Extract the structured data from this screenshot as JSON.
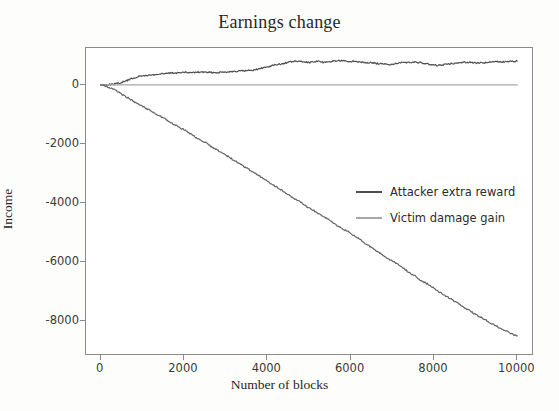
{
  "chart_data": {
    "type": "line",
    "title": "Earnings change",
    "xlabel": "Number of blocks",
    "ylabel": "Income",
    "xlim": [
      -350,
      10400
    ],
    "ylim": [
      -9200,
      1250
    ],
    "xticks": [
      0,
      2000,
      4000,
      6000,
      8000,
      10000
    ],
    "xtick_labels": [
      "0",
      "2000",
      "4000",
      "6000",
      "8000",
      "10000"
    ],
    "yticks": [
      0,
      -2000,
      -4000,
      -6000,
      -8000
    ],
    "ytick_labels": [
      "0",
      "-2000",
      "-4000",
      "-6000",
      "-8000"
    ],
    "grid": false,
    "legend_position": "center-right",
    "series": [
      {
        "name": "Attacker extra reward",
        "color": "#4f4f4f",
        "x": [
          0,
          100,
          200,
          300,
          400,
          500,
          600,
          700,
          800,
          900,
          1000,
          1100,
          1200,
          1300,
          1400,
          1500,
          1600,
          1700,
          1800,
          1900,
          2000,
          2100,
          2200,
          2300,
          2400,
          2500,
          2600,
          2700,
          2800,
          2900,
          3000,
          3100,
          3200,
          3300,
          3400,
          3500,
          3600,
          3700,
          3800,
          3900,
          4000,
          4100,
          4200,
          4300,
          4400,
          4500,
          4600,
          4700,
          4800,
          4900,
          5000,
          5100,
          5200,
          5300,
          5400,
          5500,
          5600,
          5700,
          5800,
          5900,
          6000,
          6100,
          6200,
          6300,
          6400,
          6500,
          6600,
          6700,
          6800,
          6900,
          7000,
          7100,
          7200,
          7300,
          7400,
          7500,
          7600,
          7700,
          7800,
          7900,
          8000,
          8100,
          8200,
          8300,
          8400,
          8500,
          8600,
          8700,
          8800,
          8900,
          9000,
          9100,
          9200,
          9300,
          9400,
          9500,
          9600,
          9700,
          9800,
          9900,
          10000
        ],
        "y": [
          0,
          5,
          10,
          20,
          45,
          80,
          130,
          185,
          235,
          275,
          300,
          320,
          330,
          345,
          360,
          375,
          390,
          400,
          405,
          415,
          420,
          420,
          415,
          425,
          435,
          430,
          420,
          415,
          420,
          430,
          440,
          450,
          460,
          465,
          470,
          480,
          495,
          510,
          540,
          580,
          610,
          650,
          680,
          700,
          730,
          760,
          790,
          800,
          790,
          770,
          760,
          775,
          790,
          770,
          760,
          790,
          810,
          820,
          810,
          800,
          790,
          800,
          790,
          770,
          760,
          745,
          730,
          715,
          700,
          690,
          700,
          720,
          740,
          760,
          775,
          770,
          760,
          750,
          720,
          690,
          670,
          660,
          675,
          700,
          720,
          740,
          755,
          765,
          770,
          760,
          750,
          740,
          745,
          760,
          775,
          785,
          790,
          780,
          785,
          795,
          805
        ]
      },
      {
        "name": "Victim damage gain",
        "color": "#a6a6a6",
        "x": [
          0,
          10000
        ],
        "y": [
          0,
          0
        ]
      },
      {
        "name": "victim-loss-curve",
        "color": "#636363",
        "x": [
          0,
          100,
          200,
          300,
          400,
          500,
          600,
          700,
          800,
          900,
          1000,
          1100,
          1200,
          1300,
          1400,
          1500,
          1600,
          1700,
          1800,
          1900,
          2000,
          2100,
          2200,
          2300,
          2400,
          2500,
          2600,
          2700,
          2800,
          2900,
          3000,
          3100,
          3200,
          3300,
          3400,
          3500,
          3600,
          3700,
          3800,
          3900,
          4000,
          4100,
          4200,
          4300,
          4400,
          4500,
          4600,
          4700,
          4800,
          4900,
          5000,
          5100,
          5200,
          5300,
          5400,
          5500,
          5600,
          5700,
          5800,
          5900,
          6000,
          6100,
          6200,
          6300,
          6400,
          6500,
          6600,
          6700,
          6800,
          6900,
          7000,
          7100,
          7200,
          7300,
          7400,
          7500,
          7600,
          7700,
          7800,
          7900,
          8000,
          8100,
          8200,
          8300,
          8400,
          8500,
          8600,
          8700,
          8800,
          8900,
          9000,
          9100,
          9200,
          9300,
          9400,
          9500,
          9600,
          9700,
          9800,
          9900,
          10000
        ],
        "y": [
          0,
          -40,
          -90,
          -150,
          -230,
          -310,
          -400,
          -480,
          -560,
          -640,
          -720,
          -800,
          -880,
          -960,
          -1040,
          -1120,
          -1200,
          -1290,
          -1380,
          -1450,
          -1530,
          -1620,
          -1700,
          -1790,
          -1870,
          -1950,
          -2040,
          -2130,
          -2210,
          -2290,
          -2380,
          -2470,
          -2560,
          -2650,
          -2730,
          -2820,
          -2910,
          -3000,
          -3090,
          -3180,
          -3270,
          -3360,
          -3450,
          -3540,
          -3630,
          -3720,
          -3810,
          -3900,
          -3990,
          -4080,
          -4170,
          -4260,
          -4350,
          -4440,
          -4520,
          -4600,
          -4700,
          -4790,
          -4880,
          -4960,
          -5040,
          -5130,
          -5230,
          -5330,
          -5430,
          -5520,
          -5620,
          -5720,
          -5810,
          -5900,
          -5980,
          -6050,
          -6150,
          -6260,
          -6360,
          -6450,
          -6550,
          -6640,
          -6720,
          -6800,
          -6900,
          -7000,
          -7100,
          -7180,
          -7260,
          -7350,
          -7440,
          -7530,
          -7620,
          -7710,
          -7790,
          -7870,
          -7950,
          -8030,
          -8110,
          -8190,
          -8260,
          -8330,
          -8400,
          -8470,
          -8520
        ]
      }
    ]
  },
  "legend": {
    "items": [
      {
        "label": "Attacker extra reward",
        "color": "#4f4f4f"
      },
      {
        "label": "Victim damage gain",
        "color": "#a6a6a6"
      }
    ]
  }
}
